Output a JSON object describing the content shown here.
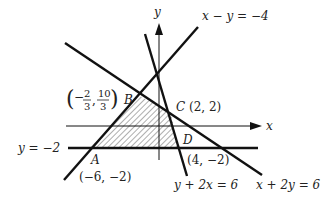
{
  "diagram": {
    "type": "linear-programming-feasible-region",
    "axes": {
      "x_label": "x",
      "y_label": "y"
    },
    "lines": [
      {
        "id": "l1",
        "equation": "x − y = −4",
        "label": "x − y = −4"
      },
      {
        "id": "l2",
        "equation": "x + 2y = 6",
        "label": "x + 2y = 6"
      },
      {
        "id": "l3",
        "equation": "y + 2x = 6",
        "label": "y + 2x = 6"
      },
      {
        "id": "l4",
        "equation": "y = −2",
        "label": "y = −2"
      }
    ],
    "vertices": [
      {
        "name": "A",
        "coords": "(−6, −2)"
      },
      {
        "name": "B",
        "coords_num_x": "2",
        "coords_den_x": "3",
        "coords_num_y": "10",
        "coords_den_y": "3"
      },
      {
        "name": "C",
        "coords": "(2, 2)"
      },
      {
        "name": "D",
        "coords": "(4, −2)"
      }
    ],
    "shaded_region": "quadrilateral ABCD (hatched)"
  }
}
